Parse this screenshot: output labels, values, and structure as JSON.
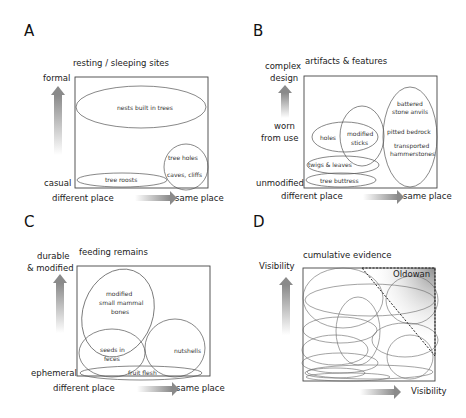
{
  "panels": {
    "A": {
      "letter": "A",
      "title": "resting / sleeping sites",
      "y_high": "formal",
      "y_low": "casual",
      "x_low": "different place",
      "x_high": "same place",
      "items": {
        "nests": "nests built in trees",
        "tree_holes": "tree holes",
        "caves": "caves, cliffs",
        "roosts": "tree roosts"
      }
    },
    "B": {
      "letter": "B",
      "title": "artifacts & features",
      "y_high_1": "complex",
      "y_high_2": "design",
      "y_mid_1": "worn",
      "y_mid_2": "from use",
      "y_low": "unmodified",
      "x_low": "different place",
      "x_high": "same place",
      "items": {
        "battered_1": "battered",
        "battered_2": "stone anvils",
        "pitted": "pitted bedrock",
        "transported_1": "transported",
        "transported_2": "hammerstones",
        "holes": "holes",
        "sticks_1": "modified",
        "sticks_2": "sticks",
        "twigs": "twigs & leaves",
        "buttress": "tree buttress"
      }
    },
    "C": {
      "letter": "C",
      "title": "feeding remains",
      "y_high_1": "durable",
      "y_high_2": "& modified",
      "y_low": "ephemeral",
      "x_low": "different place",
      "x_high": "same place",
      "items": {
        "bones_1": "modified",
        "bones_2": "small mammal",
        "bones_3": "bones",
        "seeds_1": "seeds in",
        "seeds_2": "feces",
        "nutshells": "nutshells",
        "fruit": "fruit flesh"
      }
    },
    "D": {
      "letter": "D",
      "title": "cumulative evidence",
      "y_label": "Visibility",
      "x_label": "Visibility",
      "highlight": "Oldowan"
    }
  },
  "colors": {
    "line": "#555555",
    "box": "#444444",
    "arrow_dark": "#8a8a8a",
    "arrow_light": "#ffffff",
    "oldowan_shade": "#9a9a9a"
  }
}
